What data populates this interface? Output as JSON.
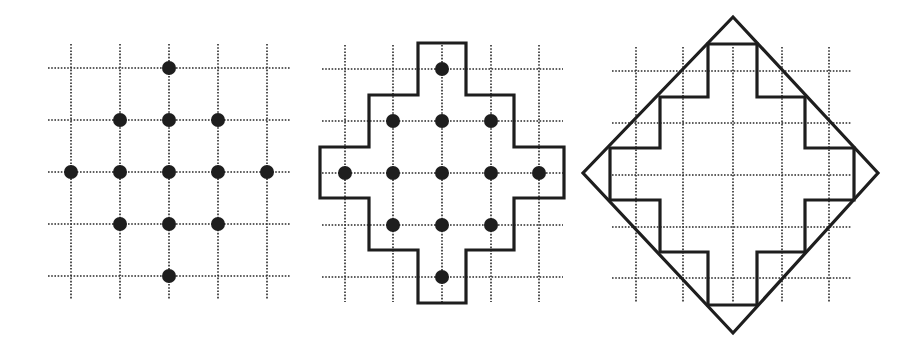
{
  "figure": {
    "panels": [
      {
        "id": "lattice-points",
        "grid": {
          "x": [
            71,
            120,
            169,
            218,
            267
          ],
          "y": [
            68,
            120,
            172,
            224,
            276
          ],
          "x_extent": [
            48,
            291
          ],
          "y_extent": [
            44,
            300
          ]
        },
        "dots": [
          [
            2,
            0
          ],
          [
            1,
            1
          ],
          [
            2,
            1
          ],
          [
            3,
            1
          ],
          [
            0,
            2
          ],
          [
            1,
            2
          ],
          [
            2,
            2
          ],
          [
            3,
            2
          ],
          [
            4,
            2
          ],
          [
            1,
            3
          ],
          [
            2,
            3
          ],
          [
            3,
            3
          ],
          [
            2,
            4
          ]
        ],
        "outline": null,
        "diamond": null
      },
      {
        "id": "lattice-points-with-staircase",
        "grid": {
          "x": [
            345,
            393,
            442,
            491,
            539
          ],
          "y": [
            69,
            121,
            173,
            225,
            277
          ],
          "x_extent": [
            322,
            563
          ],
          "y_extent": [
            45,
            302
          ]
        },
        "dots": [
          [
            2,
            0
          ],
          [
            1,
            1
          ],
          [
            2,
            1
          ],
          [
            3,
            1
          ],
          [
            0,
            2
          ],
          [
            1,
            2
          ],
          [
            2,
            2
          ],
          [
            3,
            2
          ],
          [
            4,
            2
          ],
          [
            1,
            3
          ],
          [
            2,
            3
          ],
          [
            3,
            3
          ],
          [
            2,
            4
          ]
        ],
        "outline": [
          [
            418,
            43
          ],
          [
            466,
            43
          ],
          [
            466,
            95
          ],
          [
            514,
            95
          ],
          [
            514,
            147
          ],
          [
            564,
            147
          ],
          [
            564,
            198
          ],
          [
            514,
            198
          ],
          [
            514,
            250
          ],
          [
            466,
            250
          ],
          [
            466,
            303
          ],
          [
            418,
            303
          ],
          [
            418,
            250
          ],
          [
            369,
            250
          ],
          [
            369,
            198
          ],
          [
            320,
            198
          ],
          [
            320,
            147
          ],
          [
            369,
            147
          ],
          [
            369,
            95
          ],
          [
            418,
            95
          ]
        ],
        "diamond": null
      },
      {
        "id": "staircase-with-diamond",
        "grid": {
          "x": [
            636,
            683,
            733,
            782,
            829
          ],
          "y": [
            71,
            123,
            175,
            227,
            278
          ],
          "x_extent": [
            612,
            852
          ],
          "y_extent": [
            47,
            303
          ]
        },
        "dots": [],
        "outline": [
          [
            708,
            44
          ],
          [
            757,
            44
          ],
          [
            757,
            97
          ],
          [
            805,
            97
          ],
          [
            805,
            148
          ],
          [
            854,
            148
          ],
          [
            854,
            200
          ],
          [
            805,
            200
          ],
          [
            805,
            252
          ],
          [
            757,
            252
          ],
          [
            757,
            305
          ],
          [
            708,
            305
          ],
          [
            708,
            252
          ],
          [
            660,
            252
          ],
          [
            660,
            200
          ],
          [
            610,
            200
          ],
          [
            610,
            148
          ],
          [
            660,
            148
          ],
          [
            660,
            97
          ],
          [
            708,
            97
          ]
        ],
        "diamond": [
          [
            733,
            17
          ],
          [
            878,
            173
          ],
          [
            733,
            333
          ],
          [
            583,
            173
          ]
        ]
      }
    ],
    "dot_radius": 7,
    "colors": {
      "ink": "#1e1e1e",
      "grid": "#2a2a2a",
      "background": "#ffffff"
    }
  }
}
